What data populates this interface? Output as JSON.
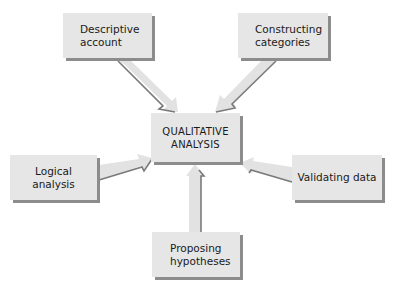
{
  "diagram": {
    "type": "hub-and-spoke",
    "center": {
      "label": "QUALITATIVE\nANALYSIS"
    },
    "nodes": [
      {
        "id": "descriptive",
        "label": "Descriptive\naccount",
        "position": "top-left"
      },
      {
        "id": "constructing",
        "label": "Constructing\ncategories",
        "position": "top-right"
      },
      {
        "id": "logical",
        "label": "Logical\nanalysis",
        "position": "left"
      },
      {
        "id": "validating",
        "label": "Validating data",
        "position": "right"
      },
      {
        "id": "proposing",
        "label": "Proposing\nhypotheses",
        "position": "bottom"
      }
    ],
    "edges": [
      {
        "from": "descriptive",
        "to": "center"
      },
      {
        "from": "constructing",
        "to": "center"
      },
      {
        "from": "logical",
        "to": "center"
      },
      {
        "from": "validating",
        "to": "center"
      },
      {
        "from": "proposing",
        "to": "center"
      }
    ],
    "colors": {
      "box_fill": "#e6e6e6",
      "box_shadow": "#8c8c8c",
      "arrow_fill": "#e2e2e2",
      "arrow_edge": "#7a7a7a",
      "text": "#1a1a1a"
    }
  }
}
